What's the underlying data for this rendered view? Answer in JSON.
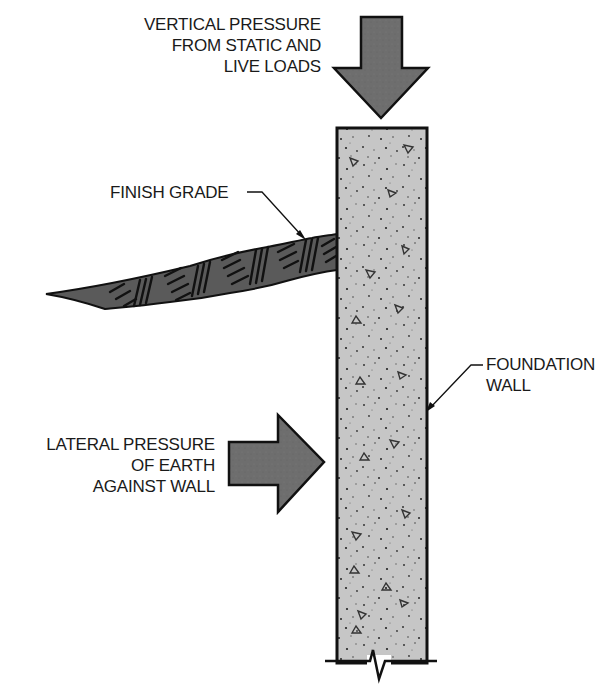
{
  "diagram": {
    "labels": {
      "vertical_pressure": [
        "VERTICAL PRESSURE",
        "FROM STATIC AND",
        "LIVE LOADS"
      ],
      "finish_grade": "FINISH GRADE",
      "foundation_wall": [
        "FOUNDATION",
        "WALL"
      ],
      "lateral_pressure": [
        "LATERAL PRESSURE",
        "OF EARTH",
        "AGAINST WALL"
      ]
    },
    "colors": {
      "arrow_fill": "#6e6e6e",
      "wall_fill": "#c4c4c4",
      "earth_fill": "#555555",
      "outline": "#111111"
    }
  }
}
